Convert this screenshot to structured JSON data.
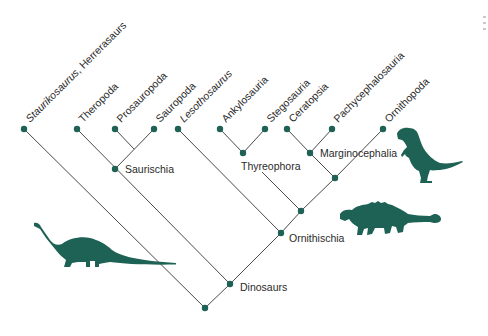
{
  "diagram": {
    "type": "cladogram",
    "colors": {
      "node": "#1d6254",
      "line": "#4a4a4a",
      "silhouette": "#1d6254",
      "text": "#2a2a2a"
    },
    "leaves": [
      {
        "id": "staurikosaurus",
        "label": "Staurikosaurus, Herrerasaurs",
        "italic_part": "Staurikosaurus",
        "x": 24,
        "y": 129
      },
      {
        "id": "theropoda",
        "label": "Theropoda",
        "x": 77,
        "y": 129
      },
      {
        "id": "prosauropoda",
        "label": "Prosauropoda",
        "x": 115,
        "y": 129
      },
      {
        "id": "sauropoda",
        "label": "Sauropoda",
        "x": 154,
        "y": 129
      },
      {
        "id": "lesothosaurus",
        "label": "Lesothosaurus",
        "italic": true,
        "x": 178,
        "y": 129
      },
      {
        "id": "ankylosauria",
        "label": "Ankylosauria",
        "x": 220,
        "y": 129
      },
      {
        "id": "stegosauria",
        "label": "Stegosauria",
        "x": 265,
        "y": 129
      },
      {
        "id": "ceratopsia",
        "label": "Ceratopsia",
        "x": 287,
        "y": 129
      },
      {
        "id": "pachycephalosauria",
        "label": "Pachycephalosauria",
        "x": 332,
        "y": 129
      },
      {
        "id": "ornithopoda",
        "label": "Ornithopoda",
        "x": 383,
        "y": 129
      }
    ],
    "clades": [
      {
        "id": "saurischia",
        "label": "Saurischia",
        "x": 115,
        "y": 169
      },
      {
        "id": "thyreophora",
        "label": "Thyreophora",
        "x": 243,
        "y": 153
      },
      {
        "id": "marginocephalia",
        "label": "Marginocephalia",
        "x": 310,
        "y": 153
      },
      {
        "id": "ornithischia",
        "label": "Ornithischia",
        "x": 281,
        "y": 233
      },
      {
        "id": "dinosaurs",
        "label": "Dinosaurs",
        "x": 230,
        "y": 284
      }
    ],
    "unlabeled_nodes": [
      {
        "id": "cerapoda",
        "x": 335,
        "y": 178
      },
      {
        "id": "genasauria",
        "x": 301,
        "y": 211
      },
      {
        "id": "root",
        "x": 205,
        "y": 308
      }
    ],
    "silhouettes": [
      {
        "id": "sauropod",
        "name": "sauropod-silhouette"
      },
      {
        "id": "ankylosaur",
        "name": "ankylosaur-silhouette"
      },
      {
        "id": "ornithopod",
        "name": "ornithopod-silhouette"
      }
    ]
  }
}
